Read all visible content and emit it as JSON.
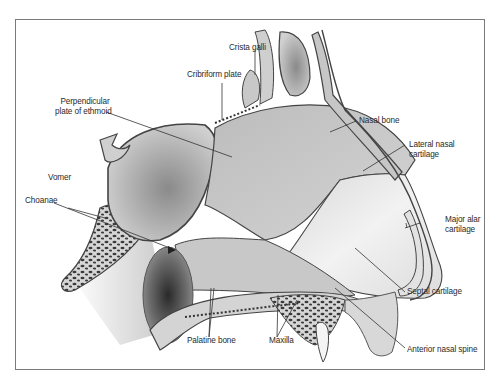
{
  "figure": {
    "frame": {
      "border_color": "#7a7a7a"
    },
    "colors": {
      "bone_outline": "#4a4a4a",
      "bone_fill": "#bdbdbd",
      "cartilage_fill": "#e2e2e2",
      "cavity_dark": "#6e6e6e",
      "soft_tissue": "#cfcfcf",
      "leader_line": "#333333"
    }
  },
  "labels": {
    "crista_galli": "Crista galli",
    "cribriform_plate": "Cribriform plate",
    "perpendicular_plate_l1": "Perpendicular",
    "perpendicular_plate_l2": "plate of ethmoid",
    "nasal_bone": "Nasal bone",
    "lateral_nasal_cartilage_l1": "Lateral nasal",
    "lateral_nasal_cartilage_l2": "cartilage",
    "vomer": "Vomer",
    "choanae": "Choanae",
    "major_alar_cartilage_l1": "Major alar",
    "major_alar_cartilage_l2": "cartilage",
    "septal_cartilage": "Septal cartilage",
    "palatine_bone": "Palatine bone",
    "maxilla": "Maxilla",
    "anterior_nasal_spine": "Anterior nasal spine"
  }
}
